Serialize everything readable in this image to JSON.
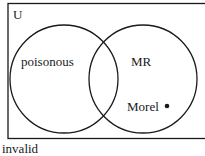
{
  "diagram": {
    "type": "venn",
    "universe_label": "U",
    "sets": [
      {
        "name": "poisonous",
        "label": "poisonous"
      },
      {
        "name": "MR",
        "label": "MR"
      }
    ],
    "elements": [
      {
        "label": "Morel",
        "region": "MR only",
        "marker": "dot"
      }
    ],
    "caption": "invalid"
  },
  "colors": {
    "stroke": "#1a1a1a",
    "background": "#ffffff"
  }
}
